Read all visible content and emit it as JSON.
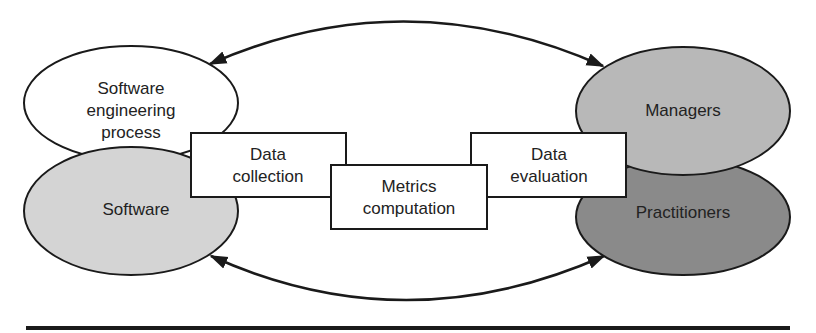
{
  "diagram": {
    "nodes": [
      {
        "id": "sep",
        "lines": [
          "Software",
          "engineering",
          "process"
        ],
        "shape": "ellipse",
        "fill": "#ffffff"
      },
      {
        "id": "software",
        "lines": [
          "Software"
        ],
        "shape": "ellipse",
        "fill": "#d4d4d4"
      },
      {
        "id": "managers",
        "lines": [
          "Managers"
        ],
        "shape": "ellipse",
        "fill": "#b8b8b8"
      },
      {
        "id": "practitioners",
        "lines": [
          "Practitioners"
        ],
        "shape": "ellipse",
        "fill": "#8a8a8a"
      },
      {
        "id": "collection",
        "lines": [
          "Data",
          "collection"
        ],
        "shape": "rect",
        "fill": "#ffffff"
      },
      {
        "id": "metrics",
        "lines": [
          "Metrics",
          "computation"
        ],
        "shape": "rect",
        "fill": "#ffffff"
      },
      {
        "id": "evaluation",
        "lines": [
          "Data",
          "evaluation"
        ],
        "shape": "rect",
        "fill": "#ffffff"
      }
    ],
    "edges": [
      {
        "from": "managers",
        "to": "sep",
        "bidirectional": true,
        "style": "curved-top"
      },
      {
        "from": "practitioners",
        "to": "software",
        "bidirectional": true,
        "style": "curved-bottom"
      }
    ],
    "colors": {
      "stroke": "#1a1a1a",
      "text": "#222222",
      "rule": "#1a1a1a"
    }
  }
}
